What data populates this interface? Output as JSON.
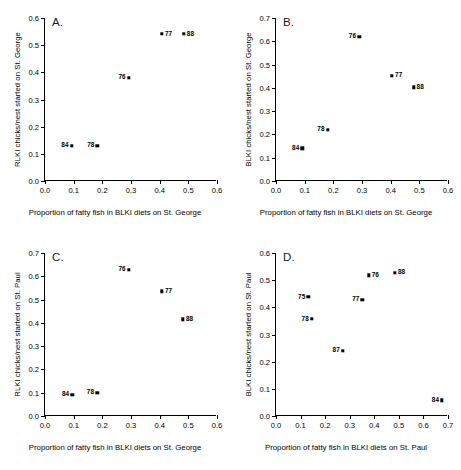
{
  "figure": {
    "panel_count": 4
  },
  "chart_data": [
    {
      "type": "scatter",
      "panel": "A.",
      "title": "",
      "xlabel": "Proportion of fatty fish in BLKI diets on St. George",
      "ylabel": "RLKI chicks/nest started on St. George",
      "xlim": [
        0.0,
        0.6
      ],
      "ylim": [
        0.0,
        0.6
      ],
      "xticks": [
        "0.0",
        "0.1",
        "0.2",
        "0.3",
        "0.4",
        "0.5",
        "0.6"
      ],
      "yticks": [
        "0.0",
        "0.1",
        "0.2",
        "0.3",
        "0.4",
        "0.5",
        "0.6"
      ],
      "grid": false,
      "legend": "none",
      "points": [
        {
          "label": "84",
          "x": 0.093,
          "y": 0.13,
          "label_side": "left"
        },
        {
          "label": "78",
          "x": 0.183,
          "y": 0.13,
          "label_side": "left"
        },
        {
          "label": "76",
          "x": 0.292,
          "y": 0.38,
          "label_side": "left"
        },
        {
          "label": "77",
          "x": 0.408,
          "y": 0.541,
          "label_side": "right"
        },
        {
          "label": "88",
          "x": 0.484,
          "y": 0.541,
          "label_side": "right"
        }
      ]
    },
    {
      "type": "scatter",
      "panel": "B.",
      "title": "",
      "xlabel": "Proportion of fatty fish in BLKI diets on St. George",
      "ylabel": "BLKI chicks/nest started on St. George",
      "xlim": [
        0.0,
        0.6
      ],
      "ylim": [
        0.0,
        0.7
      ],
      "xticks": [
        "0.0",
        "0.1",
        "0.2",
        "0.3",
        "0.4",
        "0.5",
        "0.6"
      ],
      "yticks": [
        "0.0",
        "0.1",
        "0.2",
        "0.3",
        "0.4",
        "0.5",
        "0.6",
        "0.7"
      ],
      "grid": false,
      "legend": "none",
      "points": [
        {
          "label": "84",
          "x": 0.092,
          "y": 0.14,
          "label_side": "left"
        },
        {
          "label": "78",
          "x": 0.18,
          "y": 0.22,
          "label_side": "left"
        },
        {
          "label": "76",
          "x": 0.29,
          "y": 0.62,
          "label_side": "left"
        },
        {
          "label": "77",
          "x": 0.405,
          "y": 0.452,
          "label_side": "right"
        },
        {
          "label": "88",
          "x": 0.48,
          "y": 0.403,
          "label_side": "right"
        }
      ]
    },
    {
      "type": "scatter",
      "panel": "C.",
      "title": "",
      "xlabel": "Proportion of fatty fish in BLKI diets on St. George",
      "ylabel": "RLKI chicks/nest started on St. Paul",
      "xlim": [
        0.0,
        0.6
      ],
      "ylim": [
        0.0,
        0.7
      ],
      "xticks": [
        "0.0",
        "0.1",
        "0.2",
        "0.3",
        "0.4",
        "0.5",
        "0.6"
      ],
      "yticks": [
        "0.0",
        "0.1",
        "0.2",
        "0.3",
        "0.4",
        "0.5",
        "0.6",
        "0.7"
      ],
      "grid": false,
      "legend": "none",
      "points": [
        {
          "label": "84",
          "x": 0.095,
          "y": 0.092,
          "label_side": "left"
        },
        {
          "label": "78",
          "x": 0.182,
          "y": 0.1,
          "label_side": "left"
        },
        {
          "label": "76",
          "x": 0.292,
          "y": 0.628,
          "label_side": "left"
        },
        {
          "label": "77",
          "x": 0.408,
          "y": 0.535,
          "label_side": "right"
        },
        {
          "label": "88",
          "x": 0.481,
          "y": 0.415,
          "label_side": "right"
        }
      ]
    },
    {
      "type": "scatter",
      "panel": "D.",
      "title": "",
      "xlabel": "Proportion of fatty fish in BLKI diets on St. Paul",
      "ylabel": "BLKI chicks/nest started on St. Paul",
      "xlim": [
        0.0,
        0.7
      ],
      "ylim": [
        0.0,
        0.6
      ],
      "xticks": [
        "0.0",
        "0.1",
        "0.2",
        "0.3",
        "0.4",
        "0.5",
        "0.6",
        "0.7"
      ],
      "yticks": [
        "0.0",
        "0.1",
        "0.2",
        "0.3",
        "0.4",
        "0.5",
        "0.6"
      ],
      "grid": false,
      "legend": "none",
      "points": [
        {
          "label": "75",
          "x": 0.132,
          "y": 0.438,
          "label_side": "left"
        },
        {
          "label": "78",
          "x": 0.146,
          "y": 0.357,
          "label_side": "left"
        },
        {
          "label": "87",
          "x": 0.272,
          "y": 0.24,
          "label_side": "left"
        },
        {
          "label": "77",
          "x": 0.352,
          "y": 0.427,
          "label_side": "left"
        },
        {
          "label": "76",
          "x": 0.377,
          "y": 0.518,
          "label_side": "right"
        },
        {
          "label": "88",
          "x": 0.484,
          "y": 0.528,
          "label_side": "right"
        },
        {
          "label": "84",
          "x": 0.676,
          "y": 0.058,
          "label_side": "left"
        }
      ]
    }
  ]
}
